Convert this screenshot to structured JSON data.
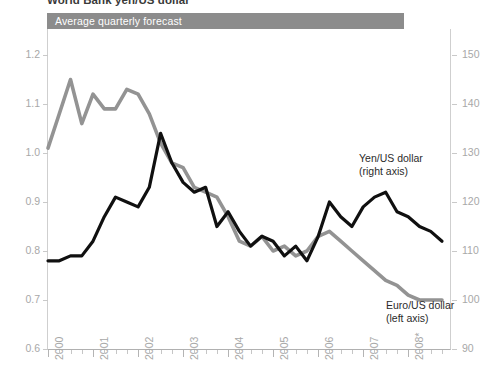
{
  "figure": {
    "cropped_heading": "World Bank yen/US dollar",
    "banner_label": "Average quarterly forecast"
  },
  "axes": {
    "left_ticks": [
      "1.2",
      "1.1",
      "1.0",
      "0.9",
      "0.8",
      "0.7",
      "0.6"
    ],
    "right_ticks": [
      "150",
      "140",
      "130",
      "120",
      "110",
      "100",
      "90"
    ],
    "x_ticks": [
      "2000",
      "2001",
      "2002",
      "2003",
      "2004",
      "2005",
      "2006",
      "2007",
      "2008*"
    ]
  },
  "annotations": {
    "yen_line1": "Yen/US dollar",
    "yen_line2": "(right axis)",
    "euro_line1": "Euro/US dollar",
    "euro_line2": "(left axis)"
  },
  "colors": {
    "banner": "#8c8c8c",
    "euro_series": "#939393",
    "yen_series": "#101010",
    "axis": "#c9c9c9"
  },
  "chart_data": {
    "type": "line",
    "title": "Average quarterly forecast",
    "xlabel": "",
    "ylabel": "Euro/US dollar",
    "y2label": "Yen/US dollar",
    "ylim": [
      0.6,
      1.2
    ],
    "y2lim": [
      90,
      150
    ],
    "grid": false,
    "legend": "inline-annotations",
    "x": [
      "2000Q1",
      "2000Q2",
      "2000Q3",
      "2000Q4",
      "2001Q1",
      "2001Q2",
      "2001Q3",
      "2001Q4",
      "2002Q1",
      "2002Q2",
      "2002Q3",
      "2002Q4",
      "2003Q1",
      "2003Q2",
      "2003Q3",
      "2003Q4",
      "2004Q1",
      "2004Q2",
      "2004Q3",
      "2004Q4",
      "2005Q1",
      "2005Q2",
      "2005Q3",
      "2005Q4",
      "2006Q1",
      "2006Q2",
      "2006Q3",
      "2006Q4",
      "2007Q1",
      "2007Q2",
      "2007Q3",
      "2007Q4",
      "2008Q1",
      "2008Q2",
      "2008Q3",
      "2008Q4"
    ],
    "series": [
      {
        "name": "Euro/US dollar (left axis)",
        "axis": "left",
        "color": "#939393",
        "values": [
          1.01,
          1.08,
          1.15,
          1.06,
          1.12,
          1.09,
          1.09,
          1.13,
          1.12,
          1.08,
          1.02,
          0.98,
          0.97,
          0.93,
          0.92,
          0.91,
          0.87,
          0.82,
          0.81,
          0.83,
          0.8,
          0.81,
          0.79,
          0.8,
          0.83,
          0.84,
          0.82,
          0.8,
          0.78,
          0.76,
          0.74,
          0.73,
          0.71,
          0.7,
          0.7,
          0.7
        ]
      },
      {
        "name": "Yen/US dollar (right axis)",
        "axis": "right",
        "color": "#101010",
        "values": [
          108,
          108,
          109,
          109,
          112,
          117,
          121,
          120,
          119,
          123,
          134,
          128,
          124,
          122,
          123,
          115,
          118,
          114,
          111,
          113,
          112,
          109,
          111,
          108,
          113,
          120,
          117,
          115,
          119,
          121,
          122,
          118,
          117,
          115,
          114,
          112
        ]
      }
    ]
  }
}
